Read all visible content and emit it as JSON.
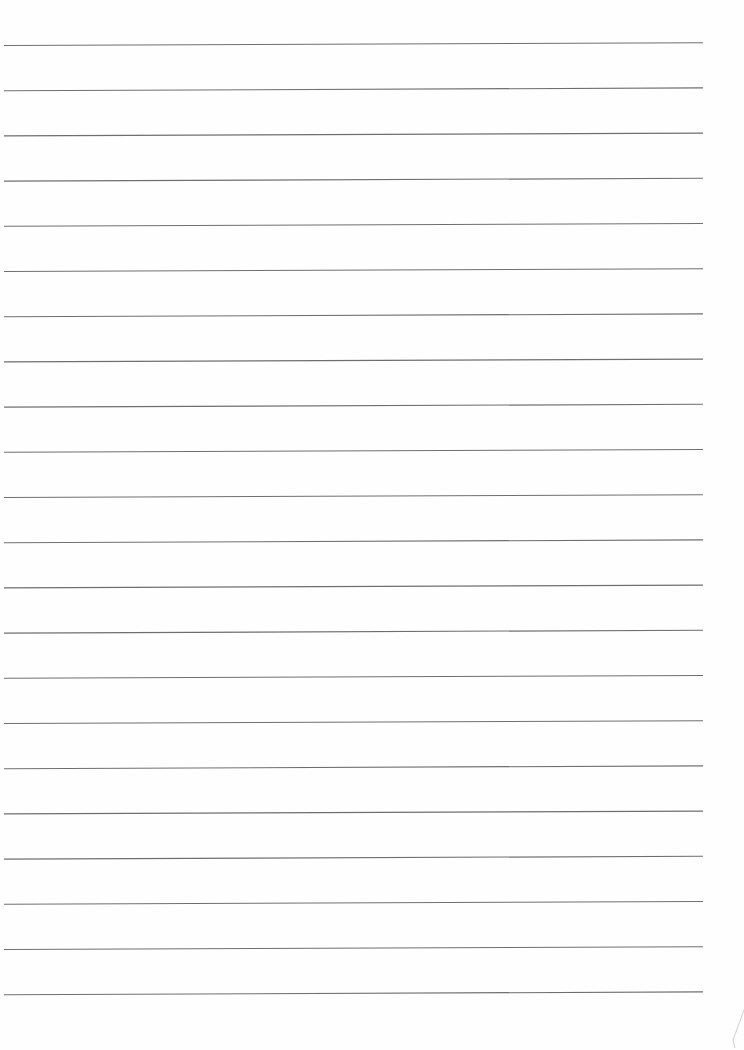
{
  "page": {
    "type": "lined-paper",
    "background_color": "#fefefe",
    "line_color": "#6f6f6f",
    "line_count": 22,
    "line_left_x": 4,
    "line_right_x": 703,
    "first_line_y_left": 45.5,
    "line_spacing": 45.2,
    "tilt_px": 2.8,
    "content_text": ""
  },
  "decorations": {
    "corner_fold_mark": {
      "present": true,
      "color": "#cfcfcf"
    }
  }
}
